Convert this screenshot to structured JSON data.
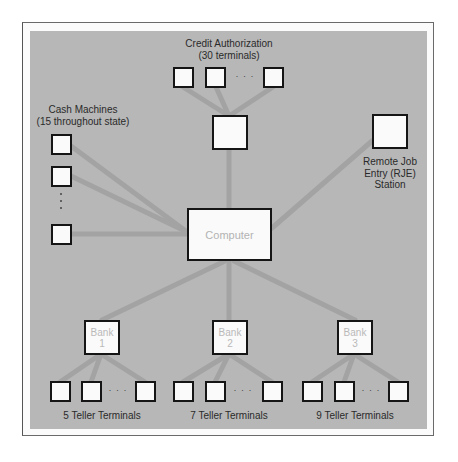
{
  "diagram": {
    "type": "network-topology",
    "colors": {
      "panel_background": "#b7b7b7",
      "link": "#a3a3a3",
      "node_fill": "#fafafa",
      "node_border": "#151515",
      "label_text": "#2a2a2a",
      "node_text": "#b9b9b9"
    },
    "center": {
      "label": "Computer"
    },
    "groups": {
      "credit": {
        "label": "Credit Authorization\n(30 terminals)",
        "ellipsis": "· · ·"
      },
      "cash": {
        "label": "Cash Machines\n(15 throughout state)"
      },
      "rje": {
        "label": "Remote Job\nEntry (RJE)\nStation"
      }
    },
    "banks": [
      {
        "label": "Bank\n1",
        "terminals_label": "5 Teller Terminals",
        "ellipsis": "· · ·"
      },
      {
        "label": "Bank\n2",
        "terminals_label": "7 Teller Terminals",
        "ellipsis": "· · ·"
      },
      {
        "label": "Bank\n3",
        "terminals_label": "9 Teller Terminals",
        "ellipsis": "· · ·"
      }
    ]
  }
}
